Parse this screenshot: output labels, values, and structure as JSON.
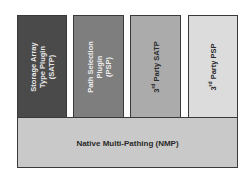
{
  "diagram": {
    "plugins": [
      {
        "lines": [
          "Storage Array",
          "Type Plugin",
          "(SATP)"
        ],
        "fill": "#4a4a4a",
        "text_color": "#e8e8e8"
      },
      {
        "lines": [
          "Path Selection",
          "Plugin",
          "(PSP)"
        ],
        "fill": "#7e7e7e",
        "text_color": "#eeeeee"
      },
      {
        "prefix": "3",
        "sup": "rd",
        "suffix": " Party SATP",
        "fill": "#ababab",
        "text_color": "#2a2a2a"
      },
      {
        "prefix": "3",
        "sup": "rd",
        "suffix": " Party PSP",
        "fill": "#dcdcdc",
        "text_color": "#2a2a2a"
      }
    ],
    "base": {
      "label": "Native Multi-Pathing (NMP)",
      "fill": "#c9c9c9"
    }
  }
}
